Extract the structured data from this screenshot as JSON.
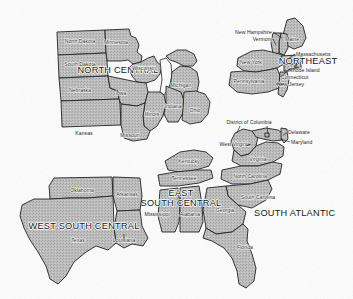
{
  "map": {
    "title": "United States Census Regions and Divisions (Eastern United States)",
    "style": {
      "background_color": "#fdfdfd",
      "state_fill_color": "#b9b9b9",
      "state_outline_color": "#1a1a1a",
      "label_color": "#171717",
      "region_label_color": "#0f0f0f",
      "water_color": "#fdfdfd"
    },
    "regions": [
      {
        "id": "north-central",
        "label": "NORTH CENTRAL",
        "states": [
          "North Dakota",
          "Minnesota",
          "South Dakota",
          "Wisconsin",
          "Michigan",
          "Nebraska",
          "Iowa",
          "Illinois",
          "Indiana",
          "Ohio",
          "Kansas",
          "Missouri"
        ]
      },
      {
        "id": "northeast",
        "label": "NORTHEAST",
        "states": [
          "Maine",
          "New Hampshire",
          "Vermont",
          "Massachusetts",
          "Rhode Island",
          "Connecticut",
          "New York",
          "New Jersey",
          "Pennsylvania"
        ]
      },
      {
        "id": "south-atlantic",
        "label": "SOUTH ATLANTIC",
        "states": [
          "Delaware",
          "Maryland",
          "District of Columbia",
          "West Virginia",
          "Virginia",
          "North Carolina",
          "South Carolina",
          "Georgia",
          "Florida"
        ]
      },
      {
        "id": "east-south-central",
        "label": "EAST SOUTH CENTRAL",
        "label_line_1": "EAST",
        "label_line_2": "SOUTH CENTRAL",
        "states": [
          "Kentucky",
          "Tennessee",
          "Mississippi",
          "Alabama"
        ]
      },
      {
        "id": "west-south-central",
        "label": "WEST SOUTH CENTRAL",
        "states": [
          "Oklahoma",
          "Arkansas",
          "Texas",
          "Louisiana"
        ]
      }
    ],
    "state_labels": {
      "north_dakota": "North Dakota",
      "minnesota": "Minnesota",
      "south_dakota": "South Dakota",
      "wisconsin": "Wisconsin",
      "michigan": "Michigan",
      "nebraska": "Nebraska",
      "iowa": "Iowa",
      "illinois": "Illinois",
      "indiana": "Indiana",
      "ohio": "Ohio",
      "kansas": "Kansas",
      "missouri": "Missouri",
      "maine": "Maine",
      "new_hampshire": "New Hampshire",
      "vermont": "Vermont",
      "massachusetts": "Massachusetts",
      "rhode_island": "Rhode Island",
      "connecticut": "Connecticut",
      "new_york": "New York",
      "new_jersey": "New Jersey",
      "pennsylvania": "Pennsylvania",
      "district_of_columbia": "District of Columbia",
      "delaware": "Delaware",
      "maryland": "Maryland",
      "west_virginia": "West Virginia",
      "virginia": "Virginia",
      "north_carolina": "North Carolina",
      "south_carolina": "South Carolina",
      "georgia": "Georgia",
      "florida": "Florida",
      "kentucky": "Kentucky",
      "tennessee": "Tennessee",
      "mississippi": "Mississippi",
      "alabama": "Alabama",
      "oklahoma": "Oklahoma",
      "arkansas": "Arkansas",
      "texas": "Texas",
      "louisiana": "Louisiana"
    },
    "region_labels": {
      "north_central": "NORTH CENTRAL",
      "northeast": "NORTHEAST",
      "south_atlantic": "SOUTH ATLANTIC",
      "east_south_central_1": "EAST",
      "east_south_central_2": "SOUTH CENTRAL",
      "west_south_central": "WEST SOUTH CENTRAL"
    }
  }
}
